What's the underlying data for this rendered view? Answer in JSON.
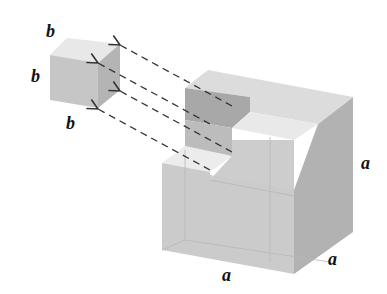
{
  "diagram": {
    "small_cube": {
      "labels": {
        "top": "b",
        "left": "b",
        "bottom": "b"
      },
      "colors": {
        "front": "#c6c6c6",
        "top": "#e8e8e8",
        "side": "#b4b4b4"
      }
    },
    "large_cube": {
      "labels": {
        "right": "a",
        "bottom_front": "a",
        "bottom_right": "a"
      },
      "colors": {
        "front": "#cbcbcb",
        "top": "#dddddd",
        "side": "#b2b2b2",
        "notch_back": "#a9a9a9",
        "notch_floor": "#ececec"
      }
    },
    "arrows": {
      "count": 4,
      "style": "dashed",
      "color": "#333333"
    }
  }
}
